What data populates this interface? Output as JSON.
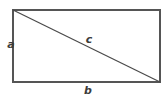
{
  "figure": {
    "type": "geometry-diagram",
    "shape": "rectangle-with-diagonal",
    "background_color": "#ffffff",
    "stroke_color": "#555555",
    "label_color": "#3c3c3c",
    "canvas": {
      "width": 168,
      "height": 106
    }
  },
  "rectangle": {
    "x": 13,
    "y": 10,
    "width": 147,
    "height": 72,
    "stroke_width": 1.2
  },
  "diagonal": {
    "x1": 13,
    "y1": 10,
    "x2": 160,
    "y2": 82,
    "stroke_width": 1.2
  },
  "labels": {
    "side_a": "a",
    "side_b": "b",
    "diagonal_c": "c"
  }
}
